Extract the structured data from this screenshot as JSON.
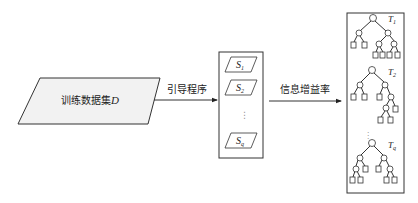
{
  "diagram": {
    "type": "flowchart",
    "input": {
      "label_cn": "训练数据集",
      "label_var": "D",
      "shape": "parallelogram",
      "fill": "#f2f2f2"
    },
    "edge1": {
      "label": "引导程序"
    },
    "samples": {
      "items": [
        {
          "base": "S",
          "sub": "1"
        },
        {
          "base": "S",
          "sub": "2"
        },
        {
          "base": "S",
          "sub": "q"
        }
      ],
      "ellipsis": "⋮"
    },
    "edge2": {
      "label": "信息增益率"
    },
    "trees": {
      "items": [
        {
          "base": "T",
          "sub": "1"
        },
        {
          "base": "T",
          "sub": "2"
        },
        {
          "base": "T",
          "sub": "q"
        }
      ],
      "ellipsis": "⋮"
    },
    "colors": {
      "stroke": "#333333",
      "input_fill": "#f2f2f2",
      "background": "#ffffff"
    }
  }
}
